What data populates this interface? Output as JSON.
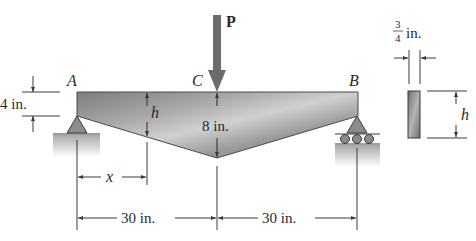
{
  "figure": {
    "type": "tapered simply supported beam with central point load",
    "load": {
      "label": "P"
    },
    "points": {
      "left_support": "A",
      "midspan": "C",
      "right_support": "B"
    },
    "dimensions": {
      "end_depth": "4 in.",
      "center_depth": "8 in.",
      "variable_depth": "h",
      "distance_from_A": "x",
      "span_left": "30 in.",
      "span_right": "30 in."
    },
    "cross_section": {
      "width_numerator": "3",
      "width_denominator": "4",
      "width_unit": "in.",
      "height": "h"
    },
    "colors": {
      "beam_fill": "#8a8a8a",
      "beam_highlight": "#cfcfcf",
      "line": "#3a3a3a",
      "arrow": "#6b6b6b",
      "ground": "#bdbdbd"
    }
  }
}
